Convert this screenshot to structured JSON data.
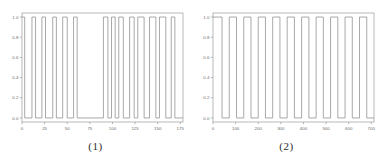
{
  "figure": {
    "panels": [
      {
        "caption": "(1)",
        "chart_data": {
          "type": "line",
          "title": "",
          "xlabel": "",
          "ylabel": "",
          "xlim": [
            0,
            178
          ],
          "ylim": [
            -0.04,
            1.04
          ],
          "grid": false,
          "legend": "none",
          "xticks": [
            0,
            25,
            50,
            75,
            100,
            125,
            150,
            175
          ],
          "xticklabels": [
            "0",
            "25",
            "50",
            "75",
            "100",
            "125",
            "150",
            "175"
          ],
          "yticks": [
            0.0,
            0.2,
            0.4,
            0.6,
            0.8,
            1.0
          ],
          "yticklabels": [
            "0.0",
            "0.2",
            "0.4",
            "0.6",
            "0.8",
            "1.0"
          ],
          "series": [
            {
              "name": "binary-signal-1",
              "color": "#8c8c8c",
              "description": "irregular square wave alternating between 0.0 and 1.0",
              "x": [
                0,
                3,
                3,
                11,
                11,
                15,
                15,
                22,
                22,
                26,
                26,
                34,
                34,
                38,
                38,
                45,
                45,
                50,
                50,
                57,
                57,
                61,
                61,
                90,
                90,
                95,
                95,
                99,
                99,
                103,
                103,
                107,
                107,
                112,
                112,
                119,
                119,
                124,
                124,
                128,
                128,
                135,
                135,
                141,
                141,
                148,
                148,
                152,
                152,
                159,
                159,
                165,
                165,
                169,
                169,
                178
              ],
              "y": [
                1.0,
                1.0,
                0.0,
                0.0,
                1.0,
                1.0,
                0.0,
                0.0,
                1.0,
                1.0,
                0.0,
                0.0,
                1.0,
                1.0,
                0.0,
                0.0,
                1.0,
                1.0,
                0.0,
                0.0,
                1.0,
                1.0,
                0.0,
                0.0,
                1.0,
                1.0,
                0.0,
                0.0,
                1.0,
                1.0,
                0.0,
                0.0,
                1.0,
                1.0,
                0.0,
                0.0,
                1.0,
                1.0,
                0.0,
                0.0,
                1.0,
                1.0,
                0.0,
                0.0,
                1.0,
                1.0,
                0.0,
                0.0,
                1.0,
                1.0,
                0.0,
                0.0,
                1.0,
                1.0,
                0.0,
                0.0
              ]
            }
          ]
        }
      },
      {
        "caption": "(2)",
        "chart_data": {
          "type": "line",
          "title": "",
          "xlabel": "",
          "ylabel": "",
          "xlim": [
            0,
            712
          ],
          "ylim": [
            -0.04,
            1.04
          ],
          "grid": false,
          "legend": "none",
          "xticks": [
            0,
            100,
            200,
            300,
            400,
            500,
            600,
            700
          ],
          "xticklabels": [
            "0",
            "100",
            "200",
            "300",
            "400",
            "500",
            "600",
            "700"
          ],
          "yticks": [
            0.0,
            0.2,
            0.4,
            0.6,
            0.8,
            1.0
          ],
          "yticklabels": [
            "0.0",
            "0.2",
            "0.4",
            "0.6",
            "0.8",
            "1.0"
          ],
          "series": [
            {
              "name": "binary-signal-2",
              "color": "#8c8c8c",
              "description": "regular periodic square wave alternating between 0.0 and 1.0 with period ~64",
              "x": [
                0,
                40,
                40,
                72,
                72,
                104,
                104,
                136,
                136,
                168,
                168,
                200,
                200,
                232,
                232,
                264,
                264,
                296,
                296,
                328,
                328,
                360,
                360,
                392,
                392,
                424,
                424,
                456,
                456,
                488,
                488,
                520,
                520,
                552,
                552,
                584,
                584,
                616,
                616,
                648,
                648,
                680,
                680,
                712
              ],
              "y": [
                1.0,
                1.0,
                0.0,
                0.0,
                1.0,
                1.0,
                0.0,
                0.0,
                1.0,
                1.0,
                0.0,
                0.0,
                1.0,
                1.0,
                0.0,
                0.0,
                1.0,
                1.0,
                0.0,
                0.0,
                1.0,
                1.0,
                0.0,
                0.0,
                1.0,
                1.0,
                0.0,
                0.0,
                1.0,
                1.0,
                0.0,
                0.0,
                1.0,
                1.0,
                0.0,
                0.0,
                1.0,
                1.0,
                0.0,
                0.0,
                1.0,
                1.0,
                0.0,
                0.0
              ]
            }
          ]
        }
      }
    ],
    "style": {
      "axis_color": "#9a9a9a",
      "line_color": "#8c8c8c",
      "tick_label_color": "#6b6b6b",
      "background": "#ffffff"
    }
  }
}
